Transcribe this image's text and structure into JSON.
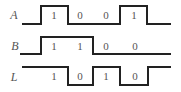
{
  "diagram": {
    "type": "timing-diagram",
    "stroke_color": "#222222",
    "text_color": "#555555",
    "signals": [
      {
        "name": "A",
        "label": "A",
        "bits": [
          "1",
          "0",
          "0",
          "1"
        ],
        "label_pos": [
          14,
          15
        ],
        "path": "M22,24 L41,24 L41,6 L68,6 L68,24 L120,24 L120,6 L147,6 L147,24 L171,24",
        "bit_pos": [
          [
            54,
            15
          ],
          [
            80,
            15
          ],
          [
            106,
            15
          ],
          [
            134,
            15
          ]
        ]
      },
      {
        "name": "B",
        "label": "B",
        "bits": [
          "1",
          "1",
          "0",
          "0"
        ],
        "label_pos": [
          15,
          46
        ],
        "path": "M20,54 L41,54 L41,37 L93,37 L93,54 L171,54",
        "bit_pos": [
          [
            54,
            46
          ],
          [
            80,
            46
          ],
          [
            106,
            46
          ],
          [
            135,
            46
          ]
        ]
      },
      {
        "name": "L",
        "label": "L",
        "bits": [
          "1",
          "0",
          "1",
          "0"
        ],
        "label_pos": [
          14,
          77
        ],
        "path": "M22,67 L68,67 L68,85 L93,85 L93,67 L120,67 L120,85 L148,85 L148,67 L171,67",
        "bit_pos": [
          [
            54,
            76
          ],
          [
            80,
            76
          ],
          [
            106,
            76
          ],
          [
            135,
            76
          ]
        ]
      }
    ]
  }
}
